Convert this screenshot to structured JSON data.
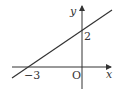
{
  "diagram": {
    "type": "line-graph",
    "x_axis_label": "x",
    "y_axis_label": "y",
    "origin_label": "O",
    "x_intercept_label": "−3",
    "y_intercept_label": "2",
    "line": {
      "x_intercept": -3,
      "y_intercept": 2
    },
    "stroke_color": "#333333"
  }
}
